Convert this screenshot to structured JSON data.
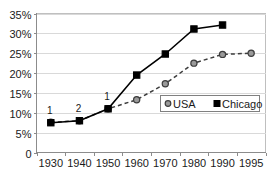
{
  "chart_data": {
    "type": "line",
    "title": "",
    "xlabel": "",
    "ylabel": "",
    "x": [
      1930,
      1940,
      1950,
      1960,
      1970,
      1980,
      1990,
      1995
    ],
    "xtick_labels": [
      "1930",
      "1940",
      "1950",
      "1960",
      "1970",
      "1980",
      "1990",
      "1995"
    ],
    "ytick_labels": [
      "35%",
      "30%",
      "25%",
      "20%",
      "15%",
      "10%",
      "5%",
      "0"
    ],
    "ytick_values": [
      35,
      30,
      25,
      20,
      15,
      10,
      5,
      0
    ],
    "ylim": [
      0,
      35
    ],
    "grid": "horizontal",
    "legend_position": "center-right",
    "series": [
      {
        "name": "USA",
        "marker": "circle",
        "linestyle": "dashed",
        "color": "#9a9a9a",
        "x": [
          1930,
          1940,
          1950,
          1960,
          1970,
          1980,
          1990,
          1995
        ],
        "values": [
          7.6,
          8.0,
          11.0,
          13.3,
          17.3,
          22.5,
          24.7,
          25.0
        ]
      },
      {
        "name": "Chicago",
        "marker": "square",
        "linestyle": "solid",
        "color": "#000000",
        "x": [
          1930,
          1940,
          1950,
          1960,
          1970,
          1980,
          1990
        ],
        "values": [
          7.5,
          8.0,
          11.0,
          19.5,
          24.8,
          31.1,
          32.1
        ]
      }
    ],
    "annotations": [
      {
        "text": "1",
        "x": 1930,
        "y": 7.5
      },
      {
        "text": "2",
        "x": 1940,
        "y": 8.0
      },
      {
        "text": "1",
        "x": 1950,
        "y": 11.0
      }
    ]
  },
  "legend": {
    "entries": [
      {
        "label": "USA",
        "marker": "circle-marker-icon"
      },
      {
        "label": "Chicago",
        "marker": "square-marker-icon"
      }
    ]
  }
}
